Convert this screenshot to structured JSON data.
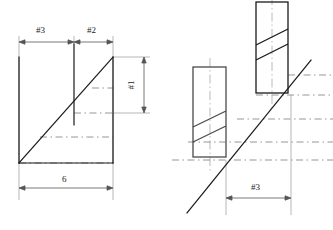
{
  "drawing": {
    "type": "engineering-orthographic-and-isometric-sketch",
    "background_color": "#ffffff",
    "line_color": "#1a1a1a",
    "hidden_line_color": "#8a8a8a",
    "center_line_color": "#9a9a9a",
    "dimension_line_color": "#555555",
    "views": {
      "left_view": {
        "name": "front-elevation-with-ramp",
        "description": "Right triangle ramp profile with vertical back face, dashed horizontal projection lines and a vertical break line",
        "dimensions": [
          {
            "id": "dim-3-top-left",
            "label": "#3",
            "orientation": "horizontal",
            "position": "top-left"
          },
          {
            "id": "dim-2-top-right",
            "label": "#2",
            "orientation": "horizontal",
            "position": "top-right"
          },
          {
            "id": "dim-1-right",
            "label": "#1",
            "orientation": "vertical",
            "position": "right"
          },
          {
            "id": "dim-6-bottom",
            "label": "6",
            "orientation": "horizontal",
            "position": "bottom"
          }
        ]
      },
      "right_view": {
        "name": "isometric-pictorial-with-two-prisms",
        "description": "Inclined plane with two rectangular prism blocks and hidden projection lines",
        "dimensions": [
          {
            "id": "dim-3-bottom-right",
            "label": "#3",
            "orientation": "horizontal",
            "position": "bottom"
          }
        ]
      }
    },
    "labels": {
      "hash_three_top": "#3",
      "hash_two_top": "#2",
      "hash_one_right": "#1",
      "six_bottom": "6",
      "hash_three_bottom": "#3"
    }
  }
}
